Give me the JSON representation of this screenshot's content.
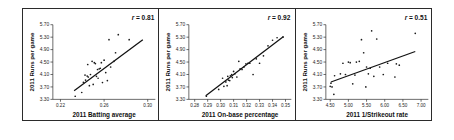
{
  "figure": {
    "name": "three-panel-scatter-figure",
    "panel_count": 3,
    "background_color": "#ffffff",
    "frame_color": "#2b2b2b",
    "point_color": "#1a1a1a",
    "line_color": "#111111"
  },
  "chart_data": [
    {
      "type": "scatter",
      "title": "",
      "xlabel": "2011 Batting average",
      "ylabel": "2011 Runs per game",
      "annotation": "r = 0.81",
      "annotation_symbol": "r",
      "annotation_value": "= 0.81",
      "correlation": 0.81,
      "xlim": [
        0.213,
        0.307
      ],
      "ylim": [
        3.3,
        5.7
      ],
      "xticks": [
        0.22,
        0.26,
        0.3
      ],
      "xticklabels": [
        "0.22",
        "0.26",
        "0.30"
      ],
      "yticks": [
        3.3,
        3.7,
        4.1,
        4.5,
        4.9,
        5.3,
        5.7
      ],
      "yticklabels": [
        "3.30",
        "3.70",
        "4.10",
        "4.50",
        "4.90",
        "5.30",
        "5.70"
      ],
      "grid": false,
      "legend": "none",
      "fit_line": {
        "x": [
          0.2325,
          0.2955
        ],
        "y": [
          3.58,
          5.22
        ]
      },
      "x": [
        0.2335,
        0.2395,
        0.241,
        0.2425,
        0.243,
        0.2445,
        0.245,
        0.2455,
        0.2465,
        0.2475,
        0.249,
        0.25,
        0.251,
        0.252,
        0.253,
        0.254,
        0.2545,
        0.2555,
        0.2565,
        0.2575,
        0.2585,
        0.26,
        0.2615,
        0.263,
        0.2645,
        0.266,
        0.269,
        0.2705,
        0.273,
        0.283
      ],
      "y": [
        3.4,
        3.52,
        3.85,
        4.08,
        3.92,
        4.05,
        4.42,
        4.02,
        3.74,
        4.1,
        4.52,
        3.78,
        4.48,
        4.45,
        4.04,
        4.26,
        3.98,
        4.28,
        4.3,
        4.48,
        3.84,
        4.56,
        4.16,
        3.9,
        5.22,
        4.34,
        4.52,
        4.8,
        5.38,
        5.22
      ]
    },
    {
      "type": "scatter",
      "title": "",
      "xlabel": "2011 On-base percentage",
      "ylabel": "2011 Runs per game",
      "annotation": "r = 0.92",
      "annotation_symbol": "r",
      "annotation_value": "= 0.92",
      "correlation": 0.92,
      "xlim": [
        0.2755,
        0.3545
      ],
      "ylim": [
        3.3,
        5.7
      ],
      "xticks": [
        0.28,
        0.29,
        0.3,
        0.31,
        0.32,
        0.33,
        0.34,
        0.35
      ],
      "xticklabels": [
        "0.28",
        "0.29",
        "0.30",
        "0.31",
        "0.32",
        "0.33",
        "0.34",
        "0.35"
      ],
      "yticks": [
        3.3,
        3.7,
        4.1,
        4.5,
        4.9,
        5.3,
        5.7
      ],
      "yticklabels": [
        "3.30",
        "3.70",
        "4.10",
        "4.50",
        "4.90",
        "5.30",
        "5.70"
      ],
      "grid": false,
      "legend": "none",
      "fit_line": {
        "x": [
          0.2885,
          0.3485
        ],
        "y": [
          3.42,
          5.32
        ]
      },
      "x": [
        0.289,
        0.2985,
        0.3015,
        0.3025,
        0.304,
        0.305,
        0.3055,
        0.306,
        0.307,
        0.3075,
        0.3085,
        0.309,
        0.31,
        0.311,
        0.3125,
        0.314,
        0.315,
        0.3165,
        0.318,
        0.3195,
        0.321,
        0.3225,
        0.325,
        0.3275,
        0.33,
        0.333,
        0.3365,
        0.34,
        0.3435,
        0.348
      ],
      "y": [
        3.4,
        3.62,
        3.98,
        3.72,
        3.86,
        3.74,
        4.04,
        3.92,
        3.9,
        4.06,
        4.1,
        4.0,
        4.2,
        4.12,
        4.02,
        4.52,
        4.28,
        4.26,
        4.34,
        4.44,
        4.46,
        4.46,
        4.1,
        4.6,
        4.46,
        4.7,
        5.02,
        5.2,
        5.28,
        5.3
      ]
    },
    {
      "type": "scatter",
      "title": "",
      "xlabel": "2011 1/Strikeout rate",
      "ylabel": "2011 Runs per game",
      "annotation": "r = 0.51",
      "annotation_symbol": "r",
      "annotation_value": "= 0.51",
      "correlation": 0.51,
      "xlim": [
        4.38,
        7.2
      ],
      "ylim": [
        3.3,
        5.7
      ],
      "xticks": [
        4.5,
        5.0,
        5.5,
        6.0,
        6.5,
        7.0
      ],
      "xticklabels": [
        "4.50",
        "5.00",
        "5.50",
        "6.00",
        "6.50",
        "7.00"
      ],
      "yticks": [
        3.3,
        3.7,
        4.1,
        4.5,
        4.9,
        5.3,
        5.7
      ],
      "yticklabels": [
        "3.30",
        "3.70",
        "4.10",
        "4.50",
        "4.90",
        "5.30",
        "5.70"
      ],
      "grid": false,
      "legend": "none",
      "fit_line": {
        "x": [
          4.52,
          6.84
        ],
        "y": [
          3.86,
          4.84
        ]
      },
      "x": [
        4.5,
        4.52,
        4.55,
        4.6,
        4.62,
        4.78,
        4.85,
        4.92,
        5.0,
        5.05,
        5.12,
        5.18,
        5.22,
        5.3,
        5.36,
        5.42,
        5.48,
        5.5,
        5.55,
        5.6,
        5.64,
        5.7,
        5.78,
        5.86,
        5.96,
        6.08,
        6.28,
        6.32,
        6.4,
        6.84
      ],
      "y": [
        3.72,
        3.82,
        3.7,
        3.46,
        4.06,
        4.12,
        4.46,
        4.1,
        4.5,
        4.48,
        3.8,
        4.08,
        4.5,
        4.52,
        5.22,
        4.8,
        3.7,
        4.34,
        4.12,
        4.3,
        5.5,
        4.04,
        5.24,
        4.34,
        4.1,
        4.46,
        4.02,
        4.44,
        4.4,
        5.42
      ]
    }
  ]
}
